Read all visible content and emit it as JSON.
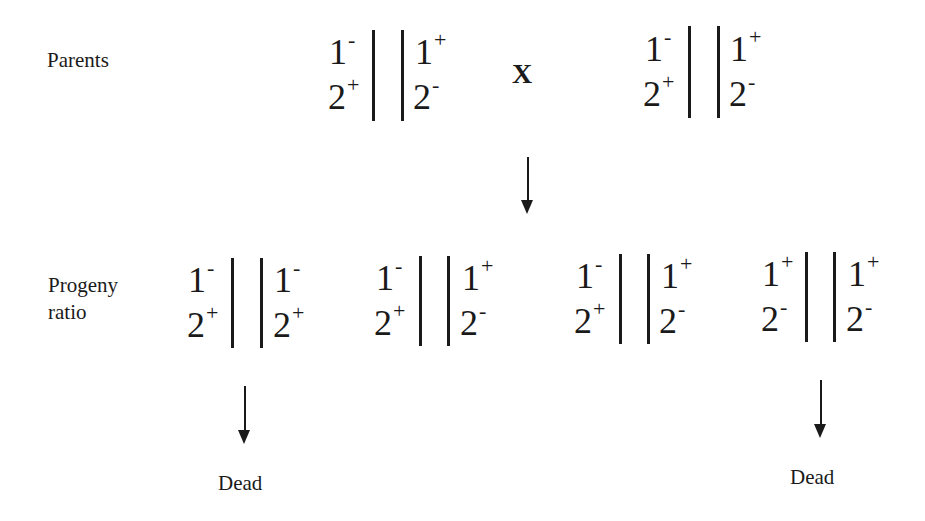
{
  "labels": {
    "parents": "Parents",
    "progeny_line1": "Progeny",
    "progeny_line2": "ratio",
    "cross_symbol": "X",
    "dead_left": "Dead",
    "dead_right": "Dead"
  },
  "parents": [
    {
      "left": {
        "top": "1",
        "top_sup": "-",
        "bottom": "2",
        "bottom_sup": "+"
      },
      "right": {
        "top": "1",
        "top_sup": "+",
        "bottom": "2",
        "bottom_sup": "-"
      }
    },
    {
      "left": {
        "top": "1",
        "top_sup": "-",
        "bottom": "2",
        "bottom_sup": "+"
      },
      "right": {
        "top": "1",
        "top_sup": "+",
        "bottom": "2",
        "bottom_sup": "-"
      }
    }
  ],
  "progeny": [
    {
      "left": {
        "top": "1",
        "top_sup": "-",
        "bottom": "2",
        "bottom_sup": "+"
      },
      "right": {
        "top": "1",
        "top_sup": "-",
        "bottom": "2",
        "bottom_sup": "+"
      },
      "outcome": "Dead"
    },
    {
      "left": {
        "top": "1",
        "top_sup": "-",
        "bottom": "2",
        "bottom_sup": "+"
      },
      "right": {
        "top": "1",
        "top_sup": "+",
        "bottom": "2",
        "bottom_sup": "-"
      }
    },
    {
      "left": {
        "top": "1",
        "top_sup": "-",
        "bottom": "2",
        "bottom_sup": "+"
      },
      "right": {
        "top": "1",
        "top_sup": "+",
        "bottom": "2",
        "bottom_sup": "-"
      }
    },
    {
      "left": {
        "top": "1",
        "top_sup": "+",
        "bottom": "2",
        "bottom_sup": "-"
      },
      "right": {
        "top": "1",
        "top_sup": "+",
        "bottom": "2",
        "bottom_sup": "-"
      },
      "outcome": "Dead"
    }
  ],
  "colors": {
    "ink": "#1a1a1a",
    "background": "#ffffff"
  }
}
